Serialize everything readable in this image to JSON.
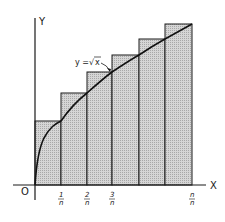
{
  "figure": {
    "curve_label": "y = √x",
    "curve_label_parts": {
      "lhs": "y =",
      "radical": "√",
      "radicand": "x"
    },
    "axes": {
      "x_label": "X",
      "y_label": "Y",
      "origin_label": "O"
    },
    "ticks": [
      {
        "num": "1",
        "den": "n"
      },
      {
        "num": "2",
        "den": "n"
      },
      {
        "num": "3",
        "den": "n"
      },
      {
        "num": "n",
        "den": "n"
      }
    ],
    "rectangles_count": 6,
    "colors": {
      "line": "#1a1a1a",
      "fill": "#c8c8c8",
      "background": "#ffffff"
    }
  }
}
